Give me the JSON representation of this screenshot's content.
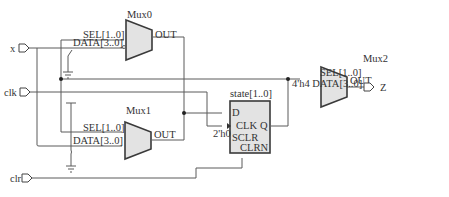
{
  "diagram": {
    "type": "RTL schematic",
    "ports": {
      "inputs": [
        {
          "name": "x",
          "label": "x"
        },
        {
          "name": "clk",
          "label": "clk"
        },
        {
          "name": "clr",
          "label": "clr"
        }
      ],
      "outputs": [
        {
          "name": "Z",
          "label": "Z"
        }
      ]
    },
    "muxes": [
      {
        "name": "Mux0",
        "title": "Mux0",
        "sel": "SEL[1..0]",
        "data": "DATA[3..0]",
        "out": "OUT"
      },
      {
        "name": "Mux1",
        "title": "Mux1",
        "sel": "SEL[1..0]",
        "data": "DATA[3..0]",
        "out": "OUT"
      },
      {
        "name": "Mux2",
        "title": "Mux2",
        "sel": "SEL[1..0]",
        "data": "4'h4 DATA[3..0]",
        "out": "OUT"
      }
    ],
    "register": {
      "title": "state[1..0]",
      "pins": {
        "d": "D",
        "clk": "CLK",
        "q": "Q",
        "sclr": "SCLR",
        "clrn": "CLRN"
      },
      "sclr_value": "2'h0"
    },
    "colors": {
      "wire": "#5a5a5a",
      "block_fill": "#e3e3e3",
      "block_stroke": "#3a3a3a"
    }
  }
}
